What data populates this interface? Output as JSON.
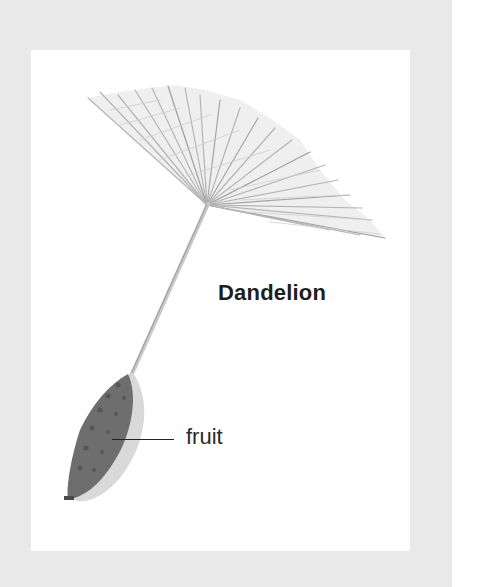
{
  "figure": {
    "title": "Dandelion",
    "labels": [
      {
        "text": "fruit",
        "target": "fruit"
      }
    ],
    "parts": [
      "pappus",
      "stalk",
      "fruit"
    ],
    "colors": {
      "background": "#e9e9e9",
      "panel": "#ffffff",
      "fruit": "#6a6a6a",
      "fruit_shadow": "#d4d4d4",
      "pappus": "#b8b8b8",
      "text": "#1e1e1e"
    }
  }
}
